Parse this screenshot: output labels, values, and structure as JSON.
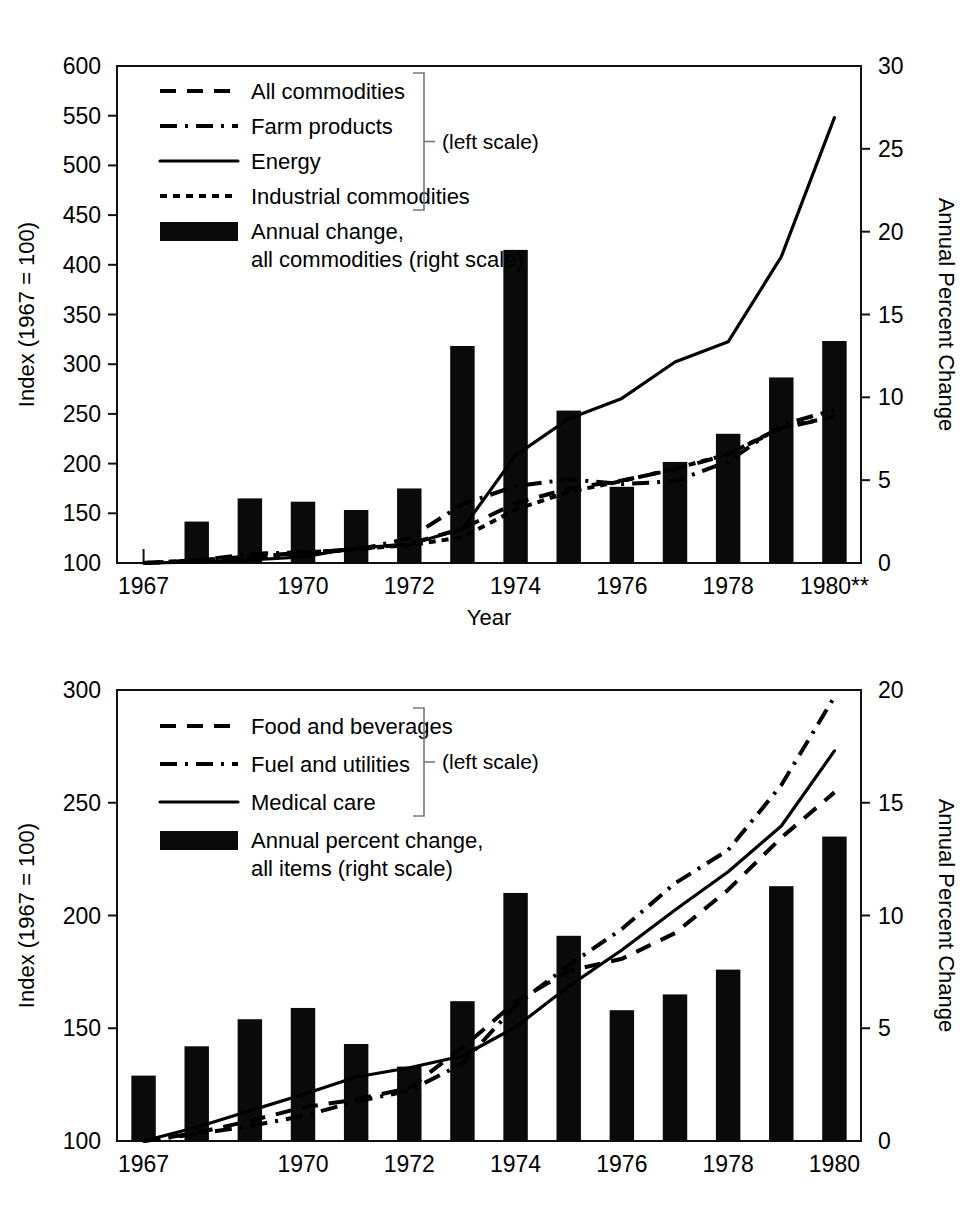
{
  "charts": [
    {
      "id": "producer-price-index",
      "left_axis": {
        "title": "Index (1967 = 100)",
        "ticks": [
          100,
          150,
          200,
          250,
          300,
          350,
          400,
          450,
          500,
          550,
          600
        ],
        "min": 100,
        "max": 600
      },
      "right_axis": {
        "title": "Annual Percent Change",
        "ticks": [
          0,
          5,
          10,
          15,
          20,
          25,
          30
        ],
        "min": 0,
        "max": 30
      },
      "x_axis": {
        "title": "Year",
        "tick_labels": [
          "1967",
          "1970",
          "1972",
          "1974",
          "1976",
          "1978",
          "1980**"
        ],
        "tick_years": [
          1967,
          1970,
          1972,
          1974,
          1976,
          1978,
          1980
        ]
      },
      "legend": {
        "bracket_note": "(left scale)",
        "entries": [
          {
            "label": "All commodities",
            "style": "dashed"
          },
          {
            "label": "Farm products",
            "style": "dash-dot"
          },
          {
            "label": "Energy",
            "style": "solid"
          },
          {
            "label": "Industrial commodities",
            "style": "dotted"
          },
          {
            "label": "Annual change,",
            "label2": "all commodities (right scale)",
            "style": "bar"
          }
        ]
      }
    },
    {
      "id": "consumer-price-index",
      "left_axis": {
        "title": "Index (1967 = 100)",
        "ticks": [
          100,
          150,
          200,
          250,
          300
        ],
        "min": 100,
        "max": 300
      },
      "right_axis": {
        "title": "Annual Percent Change",
        "ticks": [
          0,
          5,
          10,
          15,
          20
        ],
        "min": 0,
        "max": 20
      },
      "x_axis": {
        "title": "",
        "tick_labels": [
          "1967",
          "1970",
          "1972",
          "1974",
          "1976",
          "1978",
          "1980"
        ],
        "tick_years": [
          1967,
          1970,
          1972,
          1974,
          1976,
          1978,
          1980
        ]
      },
      "legend": {
        "bracket_note": "(left scale)",
        "entries": [
          {
            "label": "Food and beverages",
            "style": "dashed"
          },
          {
            "label": "Fuel and utilities",
            "style": "dash-dot"
          },
          {
            "label": "Medical care",
            "style": "solid"
          },
          {
            "label": "Annual percent change,",
            "label2": "all items (right scale)",
            "style": "bar"
          }
        ]
      }
    }
  ],
  "chart_data": [
    {
      "type": "bar",
      "title": "",
      "xlabel": "Year",
      "ylabel": "Index (1967 = 100)",
      "y2label": "Annual Percent Change",
      "ylim": [
        100,
        600
      ],
      "y2lim": [
        0,
        30
      ],
      "grid": false,
      "legend_position": "top-left",
      "x": [
        1967,
        1968,
        1969,
        1970,
        1971,
        1972,
        1973,
        1974,
        1975,
        1976,
        1977,
        1978,
        1979,
        1980
      ],
      "bars": {
        "name": "Annual change, all commodities (right scale)",
        "axis": "right",
        "unit": "percent",
        "values": [
          0.0,
          2.5,
          3.9,
          3.7,
          3.2,
          4.5,
          13.1,
          18.9,
          9.2,
          4.6,
          6.1,
          7.8,
          11.2,
          13.4
        ]
      },
      "series": [
        {
          "name": "All commodities",
          "axis": "left",
          "style": "dashed",
          "values": [
            100,
            102.5,
            106.5,
            110.4,
            113.9,
            119.1,
            134.7,
            160.1,
            174.9,
            183.0,
            194.2,
            209.3,
            235.6,
            247.0
          ]
        },
        {
          "name": "Farm products",
          "axis": "left",
          "style": "dash-dot",
          "values": [
            100,
            102.5,
            109.1,
            111.0,
            112.9,
            125.0,
            159.1,
            177.4,
            184.2,
            179.4,
            182.2,
            202.1,
            238.8,
            254.0
          ]
        },
        {
          "name": "Energy",
          "axis": "left",
          "style": "solid",
          "values": [
            100,
            100.9,
            103.0,
            106.2,
            115.2,
            118.6,
            134.3,
            208.3,
            245.1,
            265.6,
            302.2,
            322.5,
            408.1,
            548.0
          ]
        },
        {
          "name": "Industrial commodities",
          "axis": "left",
          "style": "dotted",
          "values": [
            100,
            102.5,
            106.0,
            110.0,
            114.0,
            117.9,
            125.9,
            153.8,
            171.5,
            182.4,
            195.1,
            209.4,
            236.5,
            247.0
          ]
        }
      ]
    },
    {
      "type": "bar",
      "title": "",
      "xlabel": "",
      "ylabel": "Index (1967 = 100)",
      "y2label": "Annual Percent Change",
      "ylim": [
        100,
        300
      ],
      "y2lim": [
        0,
        20
      ],
      "grid": false,
      "legend_position": "top-left",
      "x": [
        1967,
        1968,
        1969,
        1970,
        1971,
        1972,
        1973,
        1974,
        1975,
        1976,
        1977,
        1978,
        1979,
        1980
      ],
      "bars": {
        "name": "Annual percent change, all items (right scale)",
        "axis": "right",
        "unit": "percent",
        "values": [
          2.9,
          4.2,
          5.4,
          5.9,
          4.3,
          3.3,
          6.2,
          11.0,
          9.1,
          5.8,
          6.5,
          7.6,
          11.3,
          13.5
        ]
      },
      "series": [
        {
          "name": "Food and beverages",
          "axis": "left",
          "style": "dashed",
          "values": [
            100,
            103.6,
            108.9,
            114.9,
            118.4,
            123.5,
            141.4,
            161.7,
            175.4,
            180.8,
            192.2,
            211.4,
            234.5,
            254.6
          ]
        },
        {
          "name": "Fuel and utilities",
          "axis": "left",
          "style": "dash-dot",
          "values": [
            100,
            103.1,
            106.6,
            111.1,
            117.5,
            122.3,
            134.3,
            160.1,
            178.0,
            194.0,
            214.3,
            229.0,
            257.8,
            297.0
          ]
        },
        {
          "name": "Medical care",
          "axis": "left",
          "style": "solid",
          "values": [
            100,
            106.1,
            113.4,
            120.6,
            128.4,
            132.5,
            137.7,
            150.5,
            168.6,
            184.7,
            202.4,
            219.4,
            239.7,
            273.0
          ]
        }
      ]
    }
  ]
}
